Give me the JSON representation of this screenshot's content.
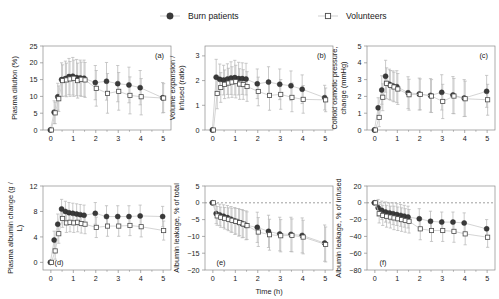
{
  "figure": {
    "xlabel": "Time (h)",
    "legend": [
      {
        "name": "burn-patients",
        "label": "Burn patients",
        "marker": "filled-circle",
        "color": "#3a3a3a"
      },
      {
        "name": "volunteers",
        "label": "Volunteers",
        "marker": "open-square",
        "color": "#3a3a3a"
      }
    ],
    "colors": {
      "marker": "#3a3a3a",
      "errorbar": "#b8b8b8",
      "axis": "#8a8a8a",
      "text": "#1a1a1a"
    },
    "xticks": [
      0,
      1,
      2,
      3,
      4,
      5
    ],
    "xlim": [
      -0.35,
      5.35
    ]
  },
  "chart_data": [
    {
      "type": "scatter",
      "panel": "(a)",
      "title": "",
      "xlabel": "",
      "ylabel": "Plasma dilution (%)",
      "xlim": [
        -0.35,
        5.35
      ],
      "ylim": [
        0,
        25
      ],
      "yticks": [
        0,
        5,
        10,
        15,
        20,
        25
      ],
      "xticks": [
        0,
        1,
        2,
        3,
        4,
        5
      ],
      "grid": false,
      "series": [
        {
          "name": "Burn patients",
          "x": [
            0,
            0.17,
            0.33,
            0.5,
            0.67,
            0.83,
            1.0,
            1.17,
            1.33,
            1.5,
            2.0,
            2.5,
            3.0,
            3.5,
            4.0,
            5.0
          ],
          "values": [
            0,
            5.3,
            9.9,
            15.0,
            15.3,
            15.9,
            16.0,
            15.6,
            15.5,
            15.4,
            14.1,
            14.5,
            13.8,
            13.4,
            12.6,
            9.6
          ],
          "err_lo": [
            0,
            3.4,
            4.0,
            5.0,
            5.2,
            5.4,
            5.6,
            5.4,
            5.3,
            5.4,
            5.1,
            5.6,
            5.4,
            5.3,
            5.1,
            4.5
          ],
          "err_hi": [
            0,
            3.4,
            4.0,
            5.0,
            5.2,
            5.4,
            5.6,
            5.4,
            5.3,
            5.4,
            5.1,
            5.6,
            5.4,
            5.3,
            5.1,
            4.5
          ]
        },
        {
          "name": "Volunteers",
          "x": [
            0,
            0.17,
            0.33,
            0.5,
            0.67,
            0.83,
            1.0,
            1.17,
            1.33,
            1.5,
            2.0,
            2.5,
            3.0,
            3.5,
            4.0,
            5.0
          ],
          "values": [
            0,
            5.1,
            9.3,
            14.7,
            14.9,
            15.2,
            15.4,
            14.7,
            15.1,
            14.9,
            12.4,
            10.9,
            11.5,
            10.3,
            9.9,
            9.5
          ],
          "err_lo": [
            0,
            3.2,
            3.8,
            4.7,
            5.0,
            5.2,
            5.4,
            5.2,
            5.1,
            5.2,
            5.3,
            5.9,
            5.6,
            5.5,
            5.4,
            4.3
          ],
          "err_hi": [
            0,
            3.2,
            3.8,
            4.7,
            5.0,
            5.2,
            5.4,
            5.2,
            5.1,
            5.2,
            5.3,
            5.9,
            5.6,
            5.5,
            5.4,
            4.3
          ]
        }
      ]
    },
    {
      "type": "scatter",
      "panel": "(b)",
      "title": "",
      "xlabel": "",
      "ylabel": "Volume expansion / infused (ratio)",
      "xlim": [
        -0.35,
        5.35
      ],
      "ylim": [
        0,
        3.4
      ],
      "yticks": [
        0,
        1,
        2,
        3
      ],
      "xticks": [
        0,
        1,
        2,
        3,
        4,
        5
      ],
      "grid": false,
      "series": [
        {
          "name": "Burn patients",
          "x": [
            0,
            0.17,
            0.33,
            0.5,
            0.67,
            0.83,
            1.0,
            1.17,
            1.33,
            1.5,
            2.0,
            2.5,
            3.0,
            3.5,
            4.0,
            5.0
          ],
          "values": [
            0,
            2.14,
            2.05,
            2.02,
            2.06,
            2.1,
            2.12,
            2.08,
            2.08,
            2.06,
            1.87,
            1.94,
            1.85,
            1.79,
            1.65,
            1.31
          ],
          "err_lo": [
            0,
            0.72,
            0.62,
            0.6,
            0.62,
            0.66,
            0.7,
            0.66,
            0.64,
            0.64,
            0.6,
            0.62,
            0.62,
            0.6,
            0.58,
            0.5
          ],
          "err_hi": [
            0,
            0.72,
            0.62,
            0.6,
            0.62,
            0.66,
            0.7,
            0.66,
            0.64,
            0.64,
            0.6,
            0.62,
            0.62,
            0.6,
            0.58,
            0.5
          ]
        },
        {
          "name": "Volunteers",
          "x": [
            0,
            0.17,
            0.33,
            0.5,
            0.67,
            0.83,
            1.0,
            1.17,
            1.33,
            1.5,
            2.0,
            2.5,
            3.0,
            3.5,
            4.0,
            5.0
          ],
          "values": [
            0,
            1.48,
            1.72,
            1.85,
            1.9,
            1.94,
            1.96,
            1.86,
            1.84,
            1.76,
            1.56,
            1.4,
            1.44,
            1.32,
            1.24,
            1.22
          ],
          "err_lo": [
            0,
            0.62,
            0.6,
            0.58,
            0.6,
            0.62,
            0.66,
            0.62,
            0.6,
            0.6,
            0.58,
            0.6,
            0.6,
            0.58,
            0.56,
            0.48
          ],
          "err_hi": [
            0,
            0.62,
            0.6,
            0.58,
            0.6,
            0.62,
            0.66,
            0.62,
            0.6,
            0.6,
            0.58,
            0.6,
            0.6,
            0.58,
            0.56,
            0.48
          ]
        }
      ]
    },
    {
      "type": "scatter",
      "panel": "(c)",
      "title": "",
      "xlabel": "",
      "ylabel": "Colloid osmotic pressure, change (mmHg)",
      "xlim": [
        -0.35,
        5.35
      ],
      "ylim": [
        0,
        5
      ],
      "yticks": [
        0,
        1,
        2,
        3,
        4,
        5
      ],
      "xticks": [
        0,
        1,
        2,
        3,
        4,
        5
      ],
      "grid": false,
      "series": [
        {
          "name": "Burn patients",
          "x": [
            0,
            0.17,
            0.33,
            0.5,
            0.67,
            0.83,
            1.0,
            1.5,
            2.0,
            2.5,
            3.0,
            3.5,
            4.0,
            5.0
          ],
          "values": [
            0,
            1.32,
            2.38,
            3.2,
            2.72,
            2.62,
            2.58,
            2.22,
            2.14,
            2.06,
            2.24,
            2.08,
            1.9,
            2.3
          ],
          "err_lo": [
            0,
            0.6,
            0.85,
            0.95,
            0.9,
            0.9,
            0.95,
            0.95,
            0.95,
            1.0,
            1.05,
            1.1,
            1.1,
            0.95
          ],
          "err_hi": [
            0,
            0.6,
            0.85,
            0.95,
            0.9,
            0.9,
            0.95,
            0.95,
            0.95,
            1.0,
            1.05,
            1.1,
            1.1,
            0.95
          ]
        },
        {
          "name": "Volunteers",
          "x": [
            0,
            0.17,
            0.33,
            0.5,
            0.67,
            0.83,
            1.0,
            1.5,
            2.0,
            2.5,
            3.0,
            3.5,
            4.0,
            5.0
          ],
          "values": [
            0,
            0.75,
            1.95,
            2.78,
            2.66,
            2.56,
            2.44,
            2.1,
            2.12,
            2.02,
            1.7,
            2.02,
            1.86,
            1.8
          ],
          "err_lo": [
            0,
            0.55,
            0.8,
            0.92,
            0.88,
            0.88,
            0.92,
            0.92,
            0.92,
            0.98,
            1.02,
            1.05,
            1.05,
            0.92
          ],
          "err_hi": [
            0,
            0.55,
            0.8,
            0.92,
            0.88,
            0.88,
            0.92,
            0.92,
            0.92,
            0.98,
            1.02,
            1.05,
            1.05,
            0.92
          ]
        }
      ]
    },
    {
      "type": "scatter",
      "panel": "(d)",
      "title": "",
      "xlabel": "",
      "ylabel": "Plasma albumin change (g/L)",
      "xlim": [
        -0.35,
        5.35
      ],
      "ylim": [
        -1.2,
        12
      ],
      "yticks": [
        0,
        4,
        8,
        12
      ],
      "xticks": [
        0,
        1,
        2,
        3,
        4,
        5
      ],
      "grid": false,
      "series": [
        {
          "name": "Burn patients",
          "x": [
            0,
            0.17,
            0.33,
            0.5,
            0.67,
            0.83,
            1.0,
            1.17,
            1.33,
            1.5,
            2.0,
            2.5,
            3.0,
            3.5,
            4.0,
            5.0
          ],
          "values": [
            0,
            3.5,
            6.0,
            8.4,
            8.0,
            7.8,
            7.7,
            7.6,
            7.5,
            7.4,
            7.7,
            7.2,
            7.2,
            7.2,
            7.3,
            7.2
          ],
          "err_lo": [
            0,
            1.4,
            1.6,
            1.5,
            1.6,
            1.6,
            1.6,
            1.6,
            1.6,
            1.6,
            1.7,
            1.7,
            1.7,
            1.7,
            1.7,
            1.6
          ],
          "err_hi": [
            0,
            1.4,
            1.6,
            1.5,
            1.6,
            1.6,
            1.6,
            1.6,
            1.6,
            1.6,
            1.7,
            1.7,
            1.7,
            1.7,
            1.7,
            1.6
          ]
        },
        {
          "name": "Volunteers",
          "x": [
            0,
            0.17,
            0.33,
            0.5,
            0.67,
            0.83,
            1.0,
            1.17,
            1.33,
            1.5,
            2.0,
            2.5,
            3.0,
            3.5,
            4.0,
            5.0
          ],
          "values": [
            0,
            1.8,
            4.5,
            6.9,
            6.2,
            6.3,
            6.2,
            6.3,
            6.1,
            6.0,
            5.5,
            5.7,
            5.7,
            5.8,
            5.6,
            5.0
          ],
          "err_lo": [
            0,
            1.3,
            1.5,
            1.4,
            1.5,
            1.5,
            1.5,
            1.5,
            1.5,
            1.5,
            1.6,
            1.6,
            1.6,
            1.6,
            1.6,
            1.5
          ],
          "err_hi": [
            0,
            1.3,
            1.5,
            1.4,
            1.5,
            1.5,
            1.5,
            1.5,
            1.5,
            1.5,
            1.6,
            1.6,
            1.6,
            1.6,
            1.6,
            1.5
          ]
        }
      ]
    },
    {
      "type": "scatter",
      "panel": "(e)",
      "title": "",
      "xlabel": "Time (h)",
      "ylabel": "Albumin leakage, % of total",
      "xlim": [
        -0.35,
        5.35
      ],
      "ylim": [
        -20,
        5
      ],
      "yticks": [
        5,
        0,
        -5,
        -10,
        -15,
        -20
      ],
      "xticks": [
        0,
        1,
        2,
        3,
        4,
        5
      ],
      "grid": false,
      "zeroline": 0,
      "series": [
        {
          "name": "Burn patients",
          "x": [
            0,
            0.17,
            0.33,
            0.5,
            0.67,
            0.83,
            1.0,
            1.17,
            1.33,
            1.5,
            2.0,
            2.5,
            3.0,
            3.5,
            4.0,
            5.0
          ],
          "values": [
            0,
            -3.2,
            -3.6,
            -4.0,
            -4.4,
            -4.9,
            -5.4,
            -5.8,
            -6.2,
            -6.7,
            -7.3,
            -8.5,
            -9.3,
            -9.4,
            -9.7,
            -12.0
          ],
          "err_lo": [
            0,
            3.0,
            3.2,
            3.4,
            3.6,
            3.8,
            4.0,
            4.1,
            4.2,
            4.3,
            4.5,
            4.8,
            5.0,
            5.1,
            5.2,
            5.4
          ],
          "err_hi": [
            0,
            3.0,
            3.2,
            3.4,
            3.6,
            3.8,
            4.0,
            4.1,
            4.2,
            4.3,
            4.5,
            4.8,
            5.0,
            5.1,
            5.2,
            5.4
          ]
        },
        {
          "name": "Volunteers",
          "x": [
            0,
            0.17,
            0.33,
            0.5,
            0.67,
            0.83,
            1.0,
            1.17,
            1.33,
            1.5,
            2.0,
            2.5,
            3.0,
            3.5,
            4.0,
            5.0
          ],
          "values": [
            0,
            -3.9,
            -4.3,
            -4.6,
            -4.9,
            -5.2,
            -5.5,
            -5.9,
            -6.3,
            -6.8,
            -8.7,
            -9.5,
            -9.8,
            -9.7,
            -10.2,
            -12.4
          ],
          "err_lo": [
            0,
            2.8,
            3.0,
            3.2,
            3.4,
            3.6,
            3.8,
            3.9,
            4.0,
            4.1,
            4.3,
            4.6,
            4.8,
            4.9,
            5.0,
            5.2
          ],
          "err_hi": [
            0,
            2.8,
            3.0,
            3.2,
            3.4,
            3.6,
            3.8,
            3.9,
            4.0,
            4.1,
            4.3,
            4.6,
            4.8,
            4.9,
            5.0,
            5.2
          ]
        }
      ]
    },
    {
      "type": "scatter",
      "panel": "(f)",
      "title": "",
      "xlabel": "",
      "ylabel": "Albumin leakage, % of infused",
      "xlim": [
        -0.35,
        5.35
      ],
      "ylim": [
        -80,
        20
      ],
      "yticks": [
        20,
        0,
        -20,
        -40,
        -60,
        -80
      ],
      "xticks": [
        0,
        1,
        2,
        3,
        4,
        5
      ],
      "grid": false,
      "zeroline": 0,
      "series": [
        {
          "name": "Burn patients",
          "x": [
            0,
            0.17,
            0.33,
            0.5,
            0.67,
            0.83,
            1.0,
            1.17,
            1.33,
            1.5,
            2.0,
            2.5,
            3.0,
            3.5,
            4.0,
            5.0
          ],
          "values": [
            0,
            -6,
            -9,
            -11,
            -12,
            -13,
            -14,
            -15,
            -16,
            -17,
            -19,
            -22,
            -23,
            -23,
            -24,
            -31
          ],
          "err_lo": [
            0,
            10,
            11,
            12,
            12,
            13,
            13,
            13,
            13,
            13,
            12,
            12,
            12,
            12,
            12,
            11
          ],
          "err_hi": [
            0,
            10,
            11,
            12,
            12,
            13,
            13,
            13,
            13,
            13,
            12,
            12,
            12,
            12,
            12,
            11
          ]
        },
        {
          "name": "Volunteers",
          "x": [
            0,
            0.17,
            0.33,
            0.5,
            0.67,
            0.83,
            1.0,
            1.17,
            1.33,
            1.5,
            2.0,
            2.5,
            3.0,
            3.5,
            4.0,
            5.0
          ],
          "values": [
            0,
            -13,
            -15,
            -16,
            -17,
            -18,
            -19,
            -20,
            -21,
            -22,
            -31,
            -33,
            -33,
            -34,
            -37,
            -41
          ],
          "err_lo": [
            0,
            11,
            12,
            13,
            13,
            14,
            14,
            14,
            14,
            14,
            13,
            13,
            13,
            13,
            13,
            12
          ],
          "err_hi": [
            0,
            11,
            12,
            13,
            13,
            14,
            14,
            14,
            14,
            14,
            13,
            13,
            13,
            13,
            13,
            12
          ]
        }
      ]
    }
  ]
}
